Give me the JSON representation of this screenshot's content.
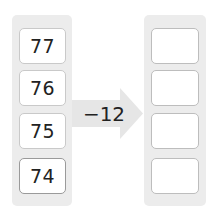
{
  "left_column": {
    "values": [
      "77",
      "76",
      "75",
      "74"
    ]
  },
  "operation": {
    "label": "−12"
  },
  "right_column": {
    "values": [
      "",
      "",
      "",
      ""
    ]
  },
  "colors": {
    "panel": "#ececec",
    "arrow": "#e6e6e6",
    "box_border": "#c9c9c9"
  }
}
